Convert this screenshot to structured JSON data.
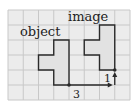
{
  "diagram": {
    "labels": {
      "object": "object",
      "image": "image",
      "horizontal": "3",
      "vertical": "1"
    },
    "grid": {
      "columns": 8,
      "rows": 6
    },
    "colors": {
      "grid_fill": "#ececec",
      "grid_line": "#c8c8c8",
      "shape_fill": "#e2e2e2",
      "outline": "#2a2a2a"
    },
    "object_shape_cells": [
      [
        2,
        3
      ],
      [
        3,
        2
      ],
      [
        3,
        3
      ],
      [
        3,
        4
      ]
    ],
    "image_shape_cells": [
      [
        5,
        2
      ],
      [
        6,
        1
      ],
      [
        6,
        2
      ],
      [
        6,
        3
      ]
    ],
    "translation": {
      "right": 3,
      "up": 1
    }
  }
}
